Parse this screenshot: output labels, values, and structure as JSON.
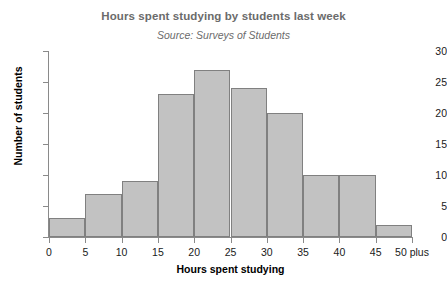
{
  "chart_data": {
    "type": "bar",
    "title": "Hours spent studying by students last week",
    "subtitle": "Source: Surveys of Students",
    "xlabel": "Hours spent studying",
    "ylabel": "Number of students",
    "categories": [
      "0-5",
      "5-10",
      "10-15",
      "15-20",
      "20-25",
      "25-30",
      "30-35",
      "35-40",
      "40-45",
      "45-50 plus"
    ],
    "values": [
      3,
      7,
      9,
      23,
      27,
      24,
      20,
      10,
      10,
      2
    ],
    "bin_edges": [
      0,
      5,
      10,
      15,
      20,
      25,
      30,
      35,
      40,
      45,
      50
    ],
    "x_tick_labels": [
      "0",
      "5",
      "10",
      "15",
      "20",
      "25",
      "30",
      "35",
      "40",
      "45",
      "50 plus"
    ],
    "y_tick_labels": [
      "0",
      "5",
      "10",
      "15",
      "20",
      "25",
      "30"
    ],
    "y_ticks": [
      0,
      5,
      10,
      15,
      20,
      25,
      30
    ],
    "ylim": [
      0,
      30
    ],
    "xlim": [
      0,
      50
    ],
    "grid": false,
    "legend": null,
    "bar_fill_color": "#c2c2c2",
    "bar_border_color": "#808080",
    "axis_color": "#8a8a8a",
    "title_color": "#6b6b6b",
    "label_color": "#000000"
  }
}
